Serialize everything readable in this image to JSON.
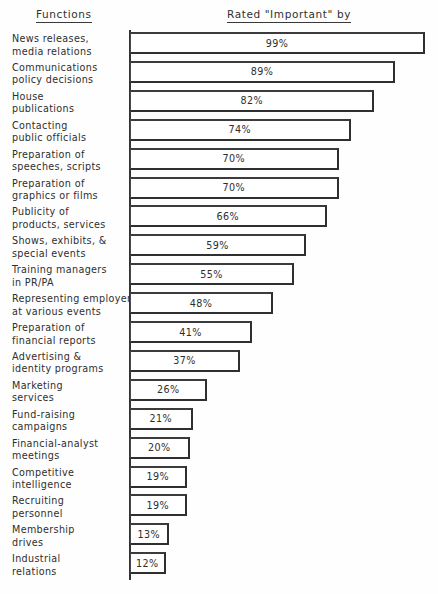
{
  "headers": {
    "functions": "Functions",
    "rated": "Rated \"Important\" by"
  },
  "chart_data": {
    "type": "bar",
    "title": "",
    "subtitle": "",
    "orientation": "horizontal",
    "xlabel": "Rated \"Important\" by",
    "ylabel": "Functions",
    "xlim": [
      0,
      100
    ],
    "grid": false,
    "legend": null,
    "value_suffix": "%",
    "categories": [
      "News releases, media relations",
      "Communications policy decisions",
      "House publications",
      "Contacting public officials",
      "Preparation of speeches, scripts",
      "Preparation of graphics or films",
      "Publicity of products, services",
      "Shows, exhibits, & special events",
      "Training managers in PR/PA",
      "Representing employer at various events",
      "Preparation of financial reports",
      "Advertising & identity programs",
      "Marketing services",
      "Fund-raising campaigns",
      "Financial-analyst meetings",
      "Competitive intelligence",
      "Recruiting personnel",
      "Membership drives",
      "Industrial relations"
    ],
    "values": [
      99,
      89,
      82,
      74,
      70,
      70,
      66,
      59,
      55,
      48,
      41,
      37,
      26,
      21,
      20,
      19,
      19,
      13,
      12
    ]
  },
  "rows": [
    {
      "line1": "News releases,",
      "line2": "media relations",
      "value": 99,
      "label": "99%"
    },
    {
      "line1": "Communications",
      "line2": "policy decisions",
      "value": 89,
      "label": "89%"
    },
    {
      "line1": "House",
      "line2": "publications",
      "value": 82,
      "label": "82%"
    },
    {
      "line1": "Contacting",
      "line2": "public officials",
      "value": 74,
      "label": "74%"
    },
    {
      "line1": "Preparation of",
      "line2": "speeches, scripts",
      "value": 70,
      "label": "70%"
    },
    {
      "line1": "Preparation of",
      "line2": "graphics or films",
      "value": 70,
      "label": "70%"
    },
    {
      "line1": "Publicity of",
      "line2": "products, services",
      "value": 66,
      "label": "66%"
    },
    {
      "line1": "Shows, exhibits, &",
      "line2": "special events",
      "value": 59,
      "label": "59%"
    },
    {
      "line1": "Training managers",
      "line2": "in PR/PA",
      "value": 55,
      "label": "55%"
    },
    {
      "line1": "Representing employer",
      "line2": "at various events",
      "value": 48,
      "label": "48%"
    },
    {
      "line1": "Preparation of",
      "line2": "financial reports",
      "value": 41,
      "label": "41%"
    },
    {
      "line1": "Advertising &",
      "line2": "identity programs",
      "value": 37,
      "label": "37%"
    },
    {
      "line1": "Marketing",
      "line2": "services",
      "value": 26,
      "label": "26%"
    },
    {
      "line1": "Fund-raising",
      "line2": "campaigns",
      "value": 21,
      "label": "21%"
    },
    {
      "line1": "Financial-analyst",
      "line2": "meetings",
      "value": 20,
      "label": "20%"
    },
    {
      "line1": "Competitive",
      "line2": "intelligence",
      "value": 19,
      "label": "19%"
    },
    {
      "line1": "Recruiting",
      "line2": "personnel",
      "value": 19,
      "label": "19%"
    },
    {
      "line1": "Membership",
      "line2": "drives",
      "value": 13,
      "label": "13%"
    },
    {
      "line1": "Industrial",
      "line2": "relations",
      "value": 12,
      "label": "12%"
    }
  ]
}
